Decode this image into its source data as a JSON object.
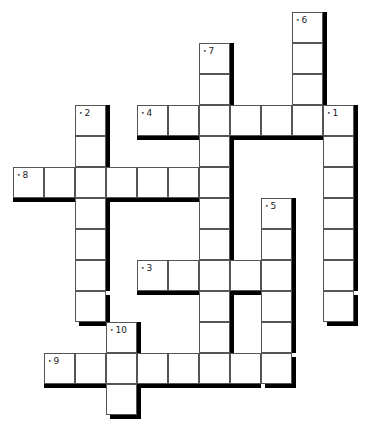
{
  "puzzle": {
    "type": "crossword",
    "cell_size": 31,
    "origin": {
      "x": 13,
      "y": 12
    },
    "cols": 11,
    "rows": 13,
    "words": [
      {
        "number": "1",
        "direction": "down",
        "row": 3,
        "col": 10,
        "length": 7
      },
      {
        "number": "2",
        "direction": "down",
        "row": 3,
        "col": 2,
        "length": 7
      },
      {
        "number": "3",
        "direction": "across",
        "row": 8,
        "col": 4,
        "length": 5
      },
      {
        "number": "4",
        "direction": "across",
        "row": 3,
        "col": 4,
        "length": 6
      },
      {
        "number": "5",
        "direction": "down",
        "row": 6,
        "col": 8,
        "length": 6
      },
      {
        "number": "6",
        "direction": "down",
        "row": 0,
        "col": 9,
        "length": 4
      },
      {
        "number": "7",
        "direction": "down",
        "row": 1,
        "col": 6,
        "length": 11
      },
      {
        "number": "8",
        "direction": "across",
        "row": 5,
        "col": 0,
        "length": 7
      },
      {
        "number": "9",
        "direction": "across",
        "row": 11,
        "col": 1,
        "length": 8
      },
      {
        "number": "10",
        "direction": "down",
        "row": 10,
        "col": 3,
        "length": 3
      }
    ]
  }
}
